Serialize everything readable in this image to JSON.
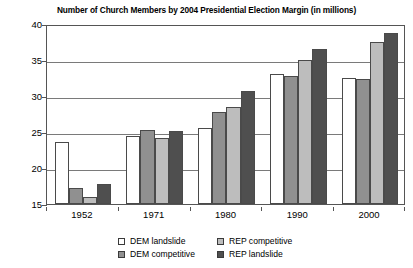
{
  "chart_data": {
    "type": "bar",
    "title": "Number of Church Members by 2004 Presidential Election Margin (in millions)",
    "xlabel": "",
    "ylabel": "",
    "categories": [
      "1952",
      "1971",
      "1980",
      "1990",
      "2000"
    ],
    "series": [
      {
        "name": "DEM landslide",
        "color": "#ffffff",
        "values": [
          23.6,
          24.5,
          25.5,
          33.0,
          32.5
        ]
      },
      {
        "name": "DEM competitive",
        "color": "#909090",
        "values": [
          17.2,
          25.3,
          27.8,
          32.8,
          32.4
        ]
      },
      {
        "name": "REP competitive",
        "color": "#bdbdbd",
        "values": [
          16.0,
          24.2,
          28.5,
          35.0,
          37.5
        ]
      },
      {
        "name": "REP landslide",
        "color": "#4f4f4f",
        "values": [
          17.8,
          25.1,
          30.7,
          36.5,
          38.7
        ]
      }
    ],
    "ylim": [
      15,
      40
    ],
    "yticks": [
      15,
      20,
      25,
      30,
      35,
      40
    ],
    "grid": true,
    "legend_position": "bottom"
  }
}
